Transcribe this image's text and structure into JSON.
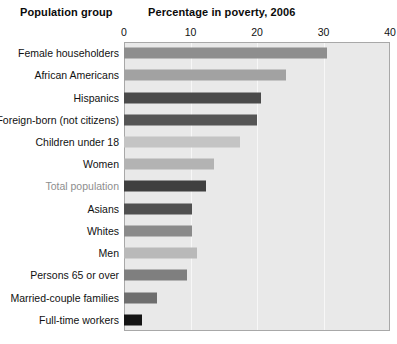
{
  "header": {
    "group_title": "Population group",
    "value_title": "Percentage in poverty, 2006"
  },
  "axis": {
    "ticks": [
      "0",
      "10",
      "20",
      "30",
      "40"
    ],
    "min": 0,
    "max": 40
  },
  "chart_data": {
    "type": "bar",
    "orientation": "horizontal",
    "title": "Percentage in poverty, 2006",
    "xlabel": "Percentage in poverty, 2006",
    "ylabel": "Population group",
    "xlim": [
      0,
      40
    ],
    "grid": true,
    "legend": "none",
    "categories": [
      "Female householders",
      "African Americans",
      "Hispanics",
      "Foreign-born (not citizens)",
      "Children under 18",
      "Women",
      "Total population",
      "Asians",
      "Whites",
      "Men",
      "Persons 65 or over",
      "Married-couple families",
      "Full-time workers"
    ],
    "values": [
      30.5,
      24.3,
      20.6,
      20.0,
      17.4,
      13.6,
      12.3,
      10.3,
      10.3,
      11.0,
      9.4,
      4.9,
      2.7
    ],
    "bar_colors": [
      "#8e8e8e",
      "#a2a2a2",
      "#4a4a4a",
      "#555555",
      "#c4c4c4",
      "#b3b3b3",
      "#3f3f3f",
      "#505050",
      "#8a8a8a",
      "#b9b9b9",
      "#7f7f7f",
      "#6e6e6e",
      "#141414"
    ],
    "highlighted_category": "Total population",
    "highlight_label_color": "#8e8e8e",
    "plot_background": "#e9e9e9",
    "gridline_color": "#f7f7f7"
  }
}
